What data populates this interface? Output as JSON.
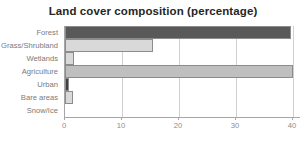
{
  "chart_data": {
    "type": "bar",
    "orientation": "horizontal",
    "title": "Land cover composition (percentage)",
    "xlabel": "",
    "ylabel": "",
    "categories": [
      "Forest",
      "Grass/Shrubland",
      "Wetlands",
      "Agriculture",
      "Urban",
      "Bare areas",
      "Snow/Ice"
    ],
    "values": [
      39.6,
      15.4,
      1.6,
      40.0,
      0.7,
      1.4,
      0.0
    ],
    "bar_colors": [
      "#595959",
      "#d9d9d9",
      "#d9d9d9",
      "#bfbfbf",
      "#404040",
      "#d9d9d9",
      "#d9d9d9"
    ],
    "xlim": [
      0,
      41.4
    ],
    "xticks": [
      0,
      10,
      20,
      30,
      40
    ],
    "xtick_labels": [
      "0",
      "10",
      "20",
      "30",
      "40"
    ],
    "grid": true,
    "grid_axis": "x",
    "legend": false
  },
  "style": {
    "title_color": "#262626",
    "label_color": "#7a7a7a",
    "tick_color": "#8c8c8c",
    "axis_color": "#a6a6a6",
    "grid_color": "#d0d0d0",
    "background": "#ffffff"
  }
}
